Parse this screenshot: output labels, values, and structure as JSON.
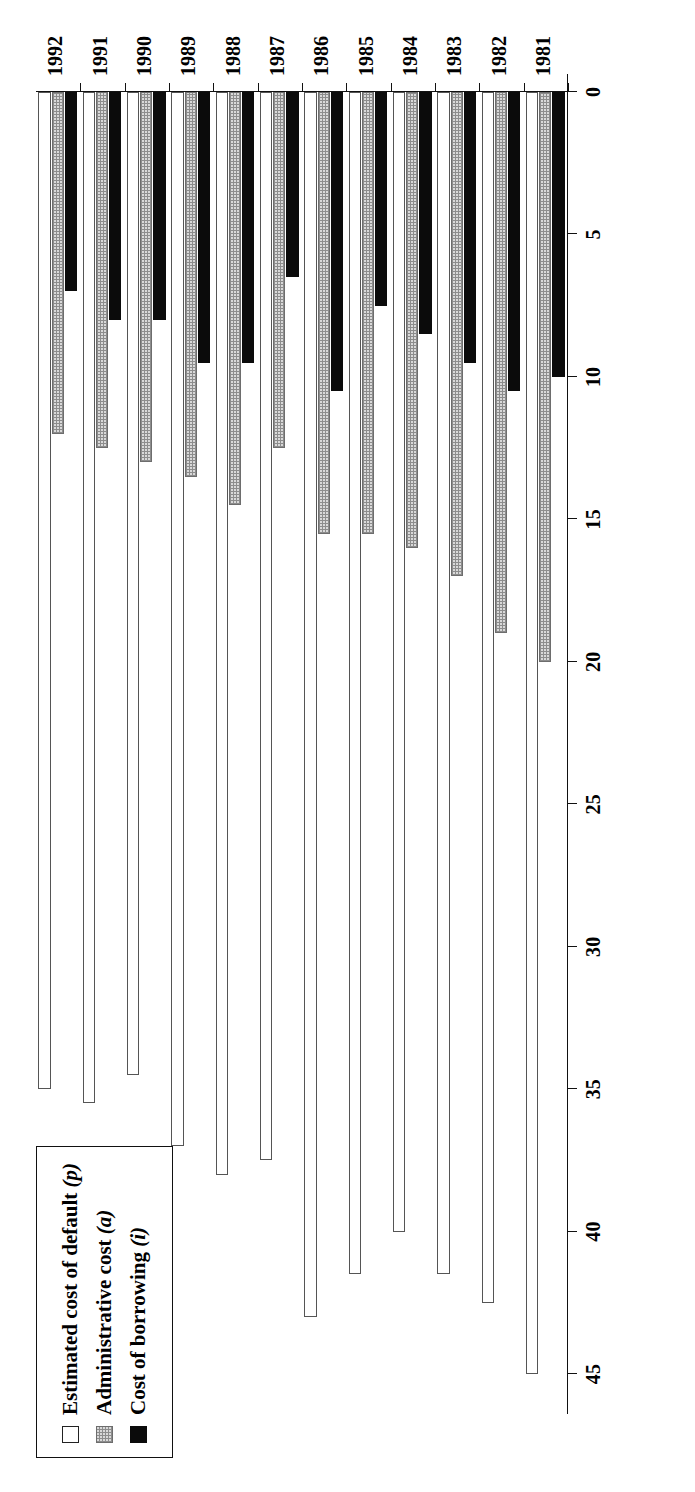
{
  "chart_data": {
    "type": "bar",
    "title": "",
    "subtitle": "",
    "orientation": "horizontal-rotated",
    "xlabel": "",
    "ylabel": "",
    "grid": false,
    "legend_position": "top-left",
    "axis": {
      "ticks": [
        45,
        40,
        35,
        30,
        25,
        20,
        15,
        10,
        5,
        0
      ],
      "tick_labels": [
        "45",
        "40",
        "35",
        "30",
        "25",
        "20",
        "15",
        "10",
        "5",
        "0"
      ],
      "range": [
        0,
        45
      ],
      "direction": "descending-left-to-right"
    },
    "categories": [
      "1981",
      "1982",
      "1983",
      "1984",
      "1985",
      "1986",
      "1987",
      "1988",
      "1989",
      "1990",
      "1991",
      "1992"
    ],
    "series": [
      {
        "name": "Estimated cost of default (p)",
        "key": "p",
        "swatch": "white",
        "color": "#ffffff",
        "values": [
          45.0,
          42.5,
          41.5,
          40.0,
          41.5,
          43.0,
          37.5,
          38.0,
          37.0,
          34.5,
          35.5,
          35.0
        ]
      },
      {
        "name": "Administrative cost (a)",
        "key": "a",
        "swatch": "stippled-gray",
        "color": "#d9d9d9",
        "values": [
          20.0,
          19.0,
          17.0,
          16.0,
          15.5,
          15.5,
          12.5,
          14.5,
          13.5,
          13.0,
          12.5,
          12.0
        ]
      },
      {
        "name": "Cost of borrowing (i)",
        "key": "i",
        "swatch": "black",
        "color": "#0b0b0b",
        "values": [
          10.0,
          10.5,
          9.5,
          8.5,
          7.5,
          10.5,
          6.5,
          9.5,
          9.5,
          8.0,
          8.0,
          7.0
        ]
      }
    ]
  },
  "legend": {
    "items": [
      {
        "label_main": "Estimated cost of default",
        "label_sym": "(p)",
        "key": "p"
      },
      {
        "label_main": "Administrative cost",
        "label_sym": "(a)",
        "key": "a"
      },
      {
        "label_main": "Cost of borrowing",
        "label_sym": "(i)",
        "key": "i"
      }
    ]
  }
}
